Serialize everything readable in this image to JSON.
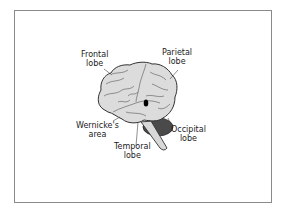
{
  "diagram": {
    "labels": {
      "frontal": {
        "line1": "Frontal",
        "line2": "lobe"
      },
      "parietal": {
        "line1": "Parietal",
        "line2": "lobe"
      },
      "wernicke": {
        "line1": "Wernicke's",
        "line2": "area"
      },
      "temporal": {
        "line1": "Temporal",
        "line2": "lobe"
      },
      "occipital": {
        "line1": "Occipital",
        "line2": "lobe"
      }
    },
    "colors": {
      "brain_fill": "#dcdcdc",
      "outline": "#333333",
      "cerebellum": "#4a4a4a",
      "wernicke_marker": "#000000",
      "frame": "#8a8a8a"
    }
  }
}
